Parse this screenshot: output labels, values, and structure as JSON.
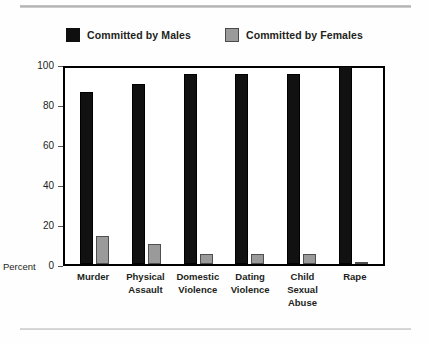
{
  "chart_data": {
    "type": "bar",
    "title": "",
    "xlabel": "",
    "ylabel": "Percent",
    "ylim": [
      0,
      100
    ],
    "yticks": [
      "0",
      "20",
      "40",
      "60",
      "80",
      "100"
    ],
    "grid": false,
    "legend_position": "top-center",
    "categories": [
      "Murder",
      "Physical Assault",
      "Domestic Violence",
      "Dating Violence",
      "Child Sexual Abuse",
      "Rape"
    ],
    "category_lines": [
      [
        "Murder"
      ],
      [
        "Physical",
        "Assault"
      ],
      [
        "Domestic",
        "Violence"
      ],
      [
        "Dating",
        "Violence"
      ],
      [
        "Child",
        "Sexual",
        "Abuse"
      ],
      [
        "Rape"
      ]
    ],
    "series": [
      {
        "name": "Committed by Males",
        "color": "#111111",
        "values": [
          86,
          90,
          95,
          95,
          95,
          99
        ]
      },
      {
        "name": "Committed by Females",
        "color": "#9a9a9a",
        "values": [
          14,
          10,
          5,
          5,
          5,
          1
        ]
      }
    ]
  },
  "legend": {
    "items": [
      {
        "label": "Committed by Males",
        "swatch": "black-square-icon"
      },
      {
        "label": "Committed by Females",
        "swatch": "gray-square-icon"
      }
    ]
  },
  "axis": {
    "percent_label": "Percent"
  }
}
